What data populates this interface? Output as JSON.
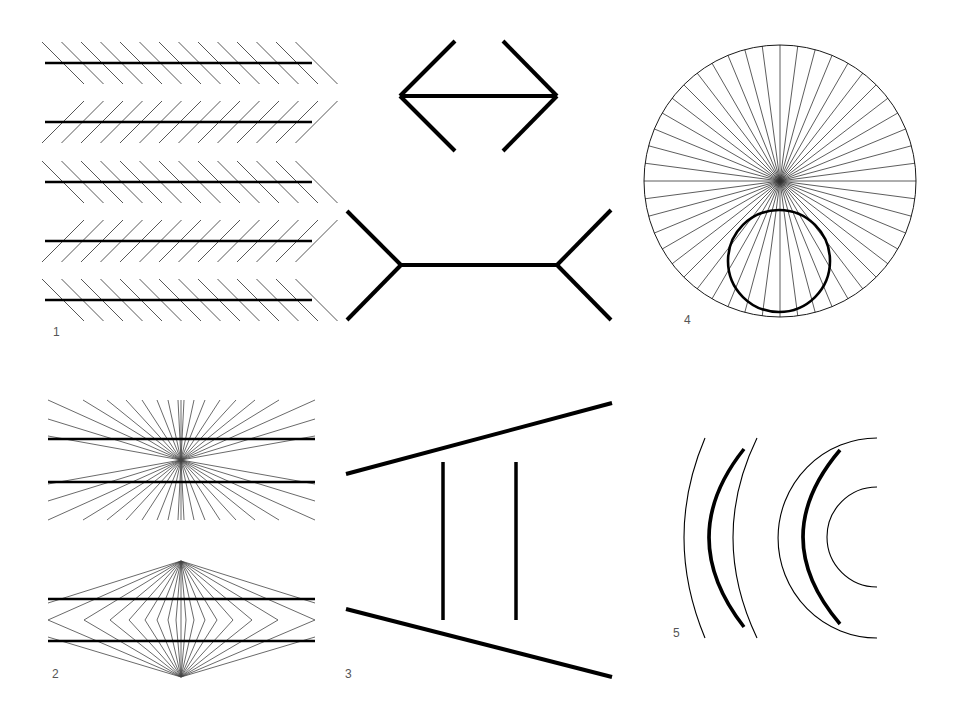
{
  "colors": {
    "ink": "#000000",
    "thin": "#333333",
    "label": "#555555",
    "background": "#ffffff"
  },
  "panels": [
    {
      "id": "zollner",
      "label": "1",
      "label_pos": [
        53,
        336
      ],
      "lines_y": [
        63,
        122,
        182,
        241,
        300
      ],
      "line_x": [
        45,
        312
      ],
      "hatch_orientation": [
        "down",
        "up",
        "down",
        "up",
        "down"
      ],
      "hatch_count": 14,
      "hatch_spacing": 19.5,
      "hatch_half": 21
    },
    {
      "id": "muller-lyer",
      "label": "",
      "top": {
        "line": [
          400,
          96,
          557,
          96
        ],
        "fins": [
          [
            455,
            41
          ],
          [
            455,
            151
          ],
          [
            503,
            41
          ],
          [
            503,
            151
          ]
        ]
      },
      "bottom": {
        "line": [
          401,
          265,
          557,
          265
        ],
        "fins": [
          [
            347,
            211
          ],
          [
            347,
            320
          ],
          [
            611,
            210
          ],
          [
            611,
            320
          ]
        ]
      }
    },
    {
      "id": "orbison",
      "label": "4",
      "label_pos": [
        684,
        324
      ],
      "outer": {
        "cx": 780,
        "cy": 181,
        "r": 136
      },
      "spokes": 48,
      "inner": {
        "cx": 779,
        "cy": 261,
        "r": 51
      }
    },
    {
      "id": "hering-wundt",
      "label": "2",
      "label_pos": [
        52,
        678
      ],
      "hering": {
        "center": [
          181,
          460
        ],
        "lines_y": [
          439,
          482
        ],
        "x_range": [
          48,
          315
        ],
        "top_y": 400,
        "bottom_y": 520,
        "top_xs": [
          83,
          107,
          126,
          142,
          157,
          168,
          178,
          181,
          184,
          194,
          205,
          220,
          236,
          255,
          279
        ],
        "side_ys": [
          400,
          419,
          436
        ]
      },
      "wundt": {
        "apex_top": [
          181,
          561
        ],
        "apex_bottom": [
          181,
          677
        ],
        "mid_y": 620,
        "mid_xs": [
          48,
          84,
          110,
          129,
          145,
          157,
          168,
          176,
          181,
          186,
          194,
          205,
          217,
          233,
          252,
          278,
          315
        ],
        "lines_y": [
          599,
          641
        ],
        "x_range": [
          48,
          315
        ],
        "extra_rays": [
          [
            [
              181,
              561
            ],
            [
              48,
              603
            ]
          ],
          [
            [
              181,
              561
            ],
            [
              315,
              603
            ]
          ],
          [
            [
              181,
              677
            ],
            [
              48,
              637
            ]
          ],
          [
            [
              181,
              677
            ],
            [
              315,
              637
            ]
          ]
        ]
      }
    },
    {
      "id": "ponzo",
      "label": "3",
      "label_pos": [
        345,
        678
      ],
      "top_rail": [
        346,
        474,
        612,
        403
      ],
      "bottom_rail": [
        346,
        609,
        612,
        677
      ],
      "verticals": [
        [
          443,
          462,
          443,
          620
        ],
        [
          516,
          462,
          516,
          620
        ]
      ]
    },
    {
      "id": "arcs",
      "label": "5",
      "label_pos": [
        673,
        637
      ],
      "left_group": [
        {
          "kind": "thin",
          "path": "M705,438 Q663,537 705,638"
        },
        {
          "kind": "thick",
          "path": "M744,449 Q674,537 744,627"
        },
        {
          "kind": "thin",
          "path": "M757,438 Q709,537 757,638"
        }
      ],
      "right_group": [
        {
          "kind": "thin",
          "path": "M877,438 A99,100 0 0 0 877,638"
        },
        {
          "kind": "thick",
          "path": "M840,450 Q766,537 840,624"
        },
        {
          "kind": "thin",
          "path": "M877,487 A50,50 0 0 0 877,587"
        }
      ]
    }
  ]
}
